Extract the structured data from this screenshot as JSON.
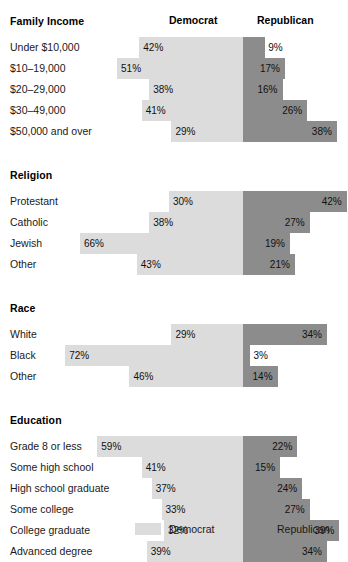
{
  "header": {
    "democrat": "Democrat",
    "republican": "Republican"
  },
  "legend": {
    "democrat": "Democrat",
    "republican": "Republican"
  },
  "colors": {
    "democrat": "#dcdcdc",
    "republican": "#8c8c8c",
    "background": "#ffffff",
    "text": "#1a1a1a"
  },
  "chart_data": {
    "type": "bar",
    "subtype": "diverging-stacked-bar",
    "title": "",
    "xlabel": "",
    "ylabel": "",
    "series": [
      {
        "name": "Democrat",
        "color": "#dcdcdc"
      },
      {
        "name": "Republican",
        "color": "#8c8c8c"
      }
    ],
    "legend_position": "bottom",
    "grid": false,
    "value_suffix": "%",
    "sections": [
      {
        "title": "Family Income",
        "rows": [
          {
            "label": "Under $10,000",
            "democrat": 42,
            "republican": 9,
            "democrat_text": "42%",
            "republican_text": "9%"
          },
          {
            "label": "$10–19,000",
            "democrat": 51,
            "republican": 17,
            "democrat_text": "51%",
            "republican_text": "17%"
          },
          {
            "label": "$20–29,000",
            "democrat": 38,
            "republican": 16,
            "democrat_text": "38%",
            "republican_text": "16%"
          },
          {
            "label": "$30–49,000",
            "democrat": 41,
            "republican": 26,
            "democrat_text": "41%",
            "republican_text": "26%"
          },
          {
            "label": "$50,000 and over",
            "democrat": 29,
            "republican": 38,
            "democrat_text": "29%",
            "republican_text": "38%"
          }
        ]
      },
      {
        "title": "Religion",
        "rows": [
          {
            "label": "Protestant",
            "democrat": 30,
            "republican": 42,
            "democrat_text": "30%",
            "republican_text": "42%"
          },
          {
            "label": "Catholic",
            "democrat": 38,
            "republican": 27,
            "democrat_text": "38%",
            "republican_text": "27%"
          },
          {
            "label": "Jewish",
            "democrat": 66,
            "republican": 19,
            "democrat_text": "66%",
            "republican_text": "19%"
          },
          {
            "label": "Other",
            "democrat": 43,
            "republican": 21,
            "democrat_text": "43%",
            "republican_text": "21%"
          }
        ]
      },
      {
        "title": "Race",
        "rows": [
          {
            "label": "White",
            "democrat": 29,
            "republican": 34,
            "democrat_text": "29%",
            "republican_text": "34%"
          },
          {
            "label": "Black",
            "democrat": 72,
            "republican": 3,
            "democrat_text": "72%",
            "republican_text": "3%"
          },
          {
            "label": "Other",
            "democrat": 46,
            "republican": 14,
            "democrat_text": "46%",
            "republican_text": "14%"
          }
        ]
      },
      {
        "title": "Education",
        "rows": [
          {
            "label": "Grade 8 or less",
            "democrat": 59,
            "republican": 22,
            "democrat_text": "59%",
            "republican_text": "22%"
          },
          {
            "label": "Some high school",
            "democrat": 41,
            "republican": 15,
            "democrat_text": "41%",
            "republican_text": "15%"
          },
          {
            "label": "High school graduate",
            "democrat": 37,
            "republican": 24,
            "democrat_text": "37%",
            "republican_text": "24%"
          },
          {
            "label": "Some college",
            "democrat": 33,
            "republican": 27,
            "democrat_text": "33%",
            "republican_text": "27%"
          },
          {
            "label": "College graduate",
            "democrat": 32,
            "republican": 39,
            "democrat_text": "32%",
            "republican_text": "39%"
          },
          {
            "label": "Advanced degree",
            "democrat": 39,
            "republican": 34,
            "democrat_text": "39%",
            "republican_text": "34%"
          }
        ]
      }
    ]
  }
}
